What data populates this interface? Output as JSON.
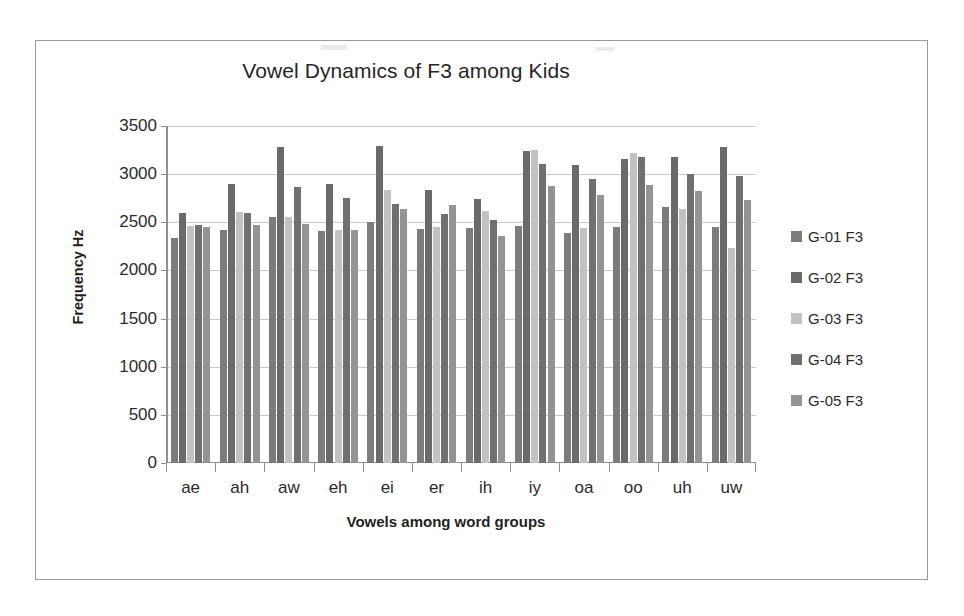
{
  "chart_data": {
    "type": "bar",
    "title": "Vowel Dynamics of F3 among Kids",
    "xlabel": "Vowels among word groups",
    "ylabel": "Frequency Hz",
    "ylim": [
      0,
      3500
    ],
    "ytick_step": 500,
    "yticks": [
      3500,
      3000,
      2500,
      2000,
      1500,
      1000,
      500,
      0
    ],
    "grid": true,
    "legend_position": "right",
    "categories": [
      "ae",
      "ah",
      "aw",
      "eh",
      "ei",
      "er",
      "ih",
      "iy",
      "oa",
      "oo",
      "uh",
      "uw"
    ],
    "series": [
      {
        "name": "G-01 F3",
        "color": "#7c7c7c",
        "values": [
          2340,
          2420,
          2550,
          2410,
          2500,
          2430,
          2440,
          2460,
          2390,
          2450,
          2660,
          2450
        ]
      },
      {
        "name": "G-02 F3",
        "color": "#6a6a6a",
        "values": [
          2600,
          2900,
          3280,
          2900,
          3290,
          2840,
          2740,
          3240,
          3100,
          3160,
          3180,
          3280
        ]
      },
      {
        "name": "G-03 F3",
        "color": "#c2c2c2",
        "values": [
          2460,
          2610,
          2560,
          2420,
          2840,
          2450,
          2620,
          3250,
          2440,
          3220,
          2640,
          2230
        ]
      },
      {
        "name": "G-04 F3",
        "color": "#707070",
        "values": [
          2470,
          2600,
          2870,
          2750,
          2690,
          2590,
          2520,
          3110,
          2950,
          3180,
          3000,
          2980
        ]
      },
      {
        "name": "G-05 F3",
        "color": "#949494",
        "values": [
          2450,
          2470,
          2480,
          2420,
          2640,
          2680,
          2360,
          2880,
          2780,
          2890,
          2830,
          2730
        ]
      }
    ]
  },
  "legend": {
    "items": [
      {
        "label": "G-01 F3"
      },
      {
        "label": "G-02 F3"
      },
      {
        "label": "G-03 F3"
      },
      {
        "label": "G-04 F3"
      },
      {
        "label": "G-05 F3"
      }
    ]
  },
  "colors": {
    "frame_border": "#9a9a9a",
    "gridline": "#c9c9c9",
    "axis": "#8f8f8f",
    "text": "#2b2b2b"
  }
}
